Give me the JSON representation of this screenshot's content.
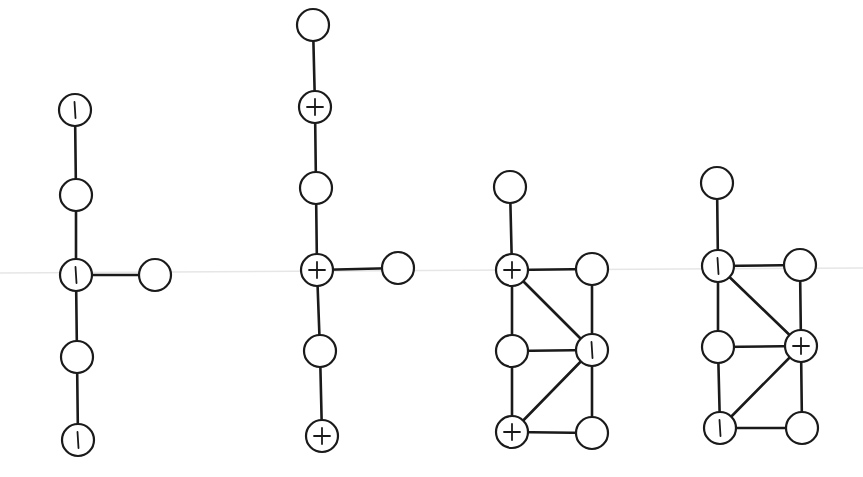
{
  "diagram": {
    "type": "signed-graphs",
    "node_radius": 16,
    "colors": {
      "stroke": "#1a1a1a",
      "fill": "#ffffff",
      "background": "#ffffff"
    },
    "graphs": [
      {
        "id": "graph-1",
        "nodes": [
          {
            "id": "a",
            "x": 75,
            "y": 110,
            "sign": "minus"
          },
          {
            "id": "b",
            "x": 76,
            "y": 195,
            "sign": "none"
          },
          {
            "id": "c",
            "x": 76,
            "y": 275,
            "sign": "minus"
          },
          {
            "id": "d",
            "x": 155,
            "y": 275,
            "sign": "none"
          },
          {
            "id": "e",
            "x": 77,
            "y": 357,
            "sign": "none"
          },
          {
            "id": "f",
            "x": 78,
            "y": 440,
            "sign": "minus"
          }
        ],
        "edges": [
          [
            "a",
            "b"
          ],
          [
            "b",
            "c"
          ],
          [
            "c",
            "d"
          ],
          [
            "c",
            "e"
          ],
          [
            "e",
            "f"
          ]
        ]
      },
      {
        "id": "graph-2",
        "nodes": [
          {
            "id": "a",
            "x": 313,
            "y": 25,
            "sign": "none"
          },
          {
            "id": "b",
            "x": 315,
            "y": 107,
            "sign": "plus"
          },
          {
            "id": "c",
            "x": 316,
            "y": 188,
            "sign": "none"
          },
          {
            "id": "d",
            "x": 317,
            "y": 270,
            "sign": "plus"
          },
          {
            "id": "e",
            "x": 398,
            "y": 268,
            "sign": "none"
          },
          {
            "id": "f",
            "x": 320,
            "y": 351,
            "sign": "none"
          },
          {
            "id": "g",
            "x": 322,
            "y": 436,
            "sign": "plus"
          }
        ],
        "edges": [
          [
            "a",
            "b"
          ],
          [
            "b",
            "c"
          ],
          [
            "c",
            "d"
          ],
          [
            "d",
            "e"
          ],
          [
            "d",
            "f"
          ],
          [
            "f",
            "g"
          ]
        ]
      },
      {
        "id": "graph-3",
        "nodes": [
          {
            "id": "a",
            "x": 510,
            "y": 187,
            "sign": "none"
          },
          {
            "id": "b",
            "x": 512,
            "y": 270,
            "sign": "plus"
          },
          {
            "id": "c",
            "x": 592,
            "y": 269,
            "sign": "none"
          },
          {
            "id": "d",
            "x": 512,
            "y": 351,
            "sign": "none"
          },
          {
            "id": "e",
            "x": 592,
            "y": 350,
            "sign": "minus"
          },
          {
            "id": "f",
            "x": 512,
            "y": 432,
            "sign": "plus"
          },
          {
            "id": "g",
            "x": 592,
            "y": 433,
            "sign": "none"
          }
        ],
        "edges": [
          [
            "a",
            "b"
          ],
          [
            "b",
            "c"
          ],
          [
            "b",
            "d"
          ],
          [
            "b",
            "e"
          ],
          [
            "c",
            "e"
          ],
          [
            "d",
            "e"
          ],
          [
            "d",
            "f"
          ],
          [
            "e",
            "f"
          ],
          [
            "e",
            "g"
          ],
          [
            "f",
            "g"
          ]
        ]
      },
      {
        "id": "graph-4",
        "nodes": [
          {
            "id": "a",
            "x": 717,
            "y": 183,
            "sign": "none"
          },
          {
            "id": "b",
            "x": 718,
            "y": 266,
            "sign": "minus"
          },
          {
            "id": "c",
            "x": 800,
            "y": 265,
            "sign": "none"
          },
          {
            "id": "d",
            "x": 718,
            "y": 347,
            "sign": "none"
          },
          {
            "id": "e",
            "x": 801,
            "y": 346,
            "sign": "plus"
          },
          {
            "id": "f",
            "x": 720,
            "y": 428,
            "sign": "minus"
          },
          {
            "id": "g",
            "x": 802,
            "y": 428,
            "sign": "none"
          }
        ],
        "edges": [
          [
            "a",
            "b"
          ],
          [
            "b",
            "c"
          ],
          [
            "b",
            "d"
          ],
          [
            "b",
            "e"
          ],
          [
            "c",
            "e"
          ],
          [
            "d",
            "e"
          ],
          [
            "d",
            "f"
          ],
          [
            "e",
            "f"
          ],
          [
            "e",
            "g"
          ],
          [
            "f",
            "g"
          ]
        ]
      }
    ]
  }
}
